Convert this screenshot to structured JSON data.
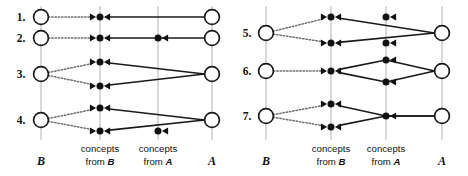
{
  "figure": {
    "background": "#ffffff",
    "ink_color": "#111111",
    "guide_color": "#b9b9b9",
    "dotted_color": "#6e6e6e"
  },
  "panels": [
    {
      "id": "left",
      "columns": [
        {
          "id": "B",
          "x": 41,
          "label_main": "B",
          "label_sub": ""
        },
        {
          "id": "conceptsB",
          "x": 100,
          "label_main": "concepts",
          "label_sub": "from B"
        },
        {
          "id": "conceptsA",
          "x": 158,
          "label_main": "concepts",
          "label_sub": "from A"
        },
        {
          "id": "A",
          "x": 212,
          "label_main": "A",
          "label_sub": ""
        }
      ],
      "rows": [
        {
          "label": "1.",
          "label_x": 21,
          "label_y": 17,
          "b_circles": [
            {
              "x": 41,
              "y": 17
            }
          ],
          "a_circles": [
            {
              "x": 212,
              "y": 17
            }
          ],
          "b_concepts": [
            {
              "x": 100,
              "y": 17
            }
          ],
          "a_concepts": [],
          "dotted": [
            {
              "x1": 41,
              "y1": 17,
              "x2": 100,
              "y2": 17
            }
          ],
          "solid": [
            {
              "x1": 212,
              "y1": 17,
              "x2": 100,
              "y2": 17
            }
          ]
        },
        {
          "label": "2.",
          "label_x": 21,
          "label_y": 38,
          "b_circles": [
            {
              "x": 41,
              "y": 38
            }
          ],
          "a_circles": [
            {
              "x": 212,
              "y": 38
            }
          ],
          "b_concepts": [
            {
              "x": 100,
              "y": 38
            }
          ],
          "a_concepts": [
            {
              "x": 158,
              "y": 38
            }
          ],
          "dotted": [
            {
              "x1": 41,
              "y1": 38,
              "x2": 100,
              "y2": 38
            }
          ],
          "solid": [
            {
              "x1": 212,
              "y1": 38,
              "x2": 100,
              "y2": 38
            }
          ]
        },
        {
          "label": "3.",
          "label_x": 21,
          "label_y": 74,
          "b_circles": [
            {
              "x": 41,
              "y": 74
            }
          ],
          "a_circles": [
            {
              "x": 212,
              "y": 74
            }
          ],
          "b_concepts": [
            {
              "x": 100,
              "y": 62
            },
            {
              "x": 100,
              "y": 86
            }
          ],
          "a_concepts": [],
          "dotted": [
            {
              "x1": 41,
              "y1": 74,
              "x2": 100,
              "y2": 62
            },
            {
              "x1": 41,
              "y1": 74,
              "x2": 100,
              "y2": 86
            }
          ],
          "solid": [
            {
              "x1": 212,
              "y1": 74,
              "x2": 100,
              "y2": 62
            },
            {
              "x1": 212,
              "y1": 74,
              "x2": 100,
              "y2": 86
            }
          ]
        },
        {
          "label": "4.",
          "label_x": 21,
          "label_y": 120,
          "b_circles": [
            {
              "x": 41,
              "y": 120
            }
          ],
          "a_circles": [
            {
              "x": 212,
              "y": 120
            }
          ],
          "b_concepts": [
            {
              "x": 100,
              "y": 108
            },
            {
              "x": 100,
              "y": 131
            }
          ],
          "a_concepts": [
            {
              "x": 158,
              "y": 131
            }
          ],
          "dotted": [
            {
              "x1": 41,
              "y1": 120,
              "x2": 100,
              "y2": 108
            },
            {
              "x1": 41,
              "y1": 120,
              "x2": 100,
              "y2": 131
            }
          ],
          "solid": [
            {
              "x1": 212,
              "y1": 120,
              "x2": 100,
              "y2": 108
            },
            {
              "x1": 212,
              "y1": 120,
              "x2": 100,
              "y2": 131
            }
          ]
        }
      ]
    },
    {
      "id": "right",
      "columns": [
        {
          "id": "B",
          "x": 32,
          "label_main": "B",
          "label_sub": ""
        },
        {
          "id": "conceptsB",
          "x": 97,
          "label_main": "concepts",
          "label_sub": "from B"
        },
        {
          "id": "conceptsA",
          "x": 152,
          "label_main": "concepts",
          "label_sub": "from A"
        },
        {
          "id": "A",
          "x": 208,
          "label_main": "A",
          "label_sub": ""
        }
      ],
      "rows": [
        {
          "label": "5.",
          "label_x": 13,
          "label_y": 33,
          "b_circles": [
            {
              "x": 32,
              "y": 33
            }
          ],
          "a_circles": [
            {
              "x": 208,
              "y": 33
            }
          ],
          "b_concepts": [
            {
              "x": 97,
              "y": 17
            },
            {
              "x": 97,
              "y": 43
            }
          ],
          "a_concepts": [
            {
              "x": 152,
              "y": 17
            },
            {
              "x": 152,
              "y": 43
            }
          ],
          "dotted": [
            {
              "x1": 32,
              "y1": 33,
              "x2": 97,
              "y2": 17
            },
            {
              "x1": 32,
              "y1": 33,
              "x2": 97,
              "y2": 43
            }
          ],
          "solid": [
            {
              "x1": 208,
              "y1": 33,
              "x2": 97,
              "y2": 17
            },
            {
              "x1": 208,
              "y1": 33,
              "x2": 97,
              "y2": 43
            }
          ]
        },
        {
          "label": "6.",
          "label_x": 13,
          "label_y": 71,
          "b_circles": [
            {
              "x": 32,
              "y": 71
            }
          ],
          "a_circles": [
            {
              "x": 208,
              "y": 71
            }
          ],
          "b_concepts": [
            {
              "x": 97,
              "y": 71
            }
          ],
          "a_concepts": [
            {
              "x": 152,
              "y": 60
            },
            {
              "x": 152,
              "y": 82
            }
          ],
          "dotted": [
            {
              "x1": 32,
              "y1": 71,
              "x2": 97,
              "y2": 71
            }
          ],
          "solid": [
            {
              "x1": 208,
              "y1": 71,
              "x2": 97,
              "y2": 71,
              "via_y": 60
            },
            {
              "x1": 208,
              "y1": 71,
              "x2": 97,
              "y2": 71,
              "via_y": 82
            }
          ]
        },
        {
          "label": "7.",
          "label_x": 13,
          "label_y": 116,
          "b_circles": [
            {
              "x": 32,
              "y": 116
            }
          ],
          "a_circles": [
            {
              "x": 208,
              "y": 116
            }
          ],
          "b_concepts": [
            {
              "x": 97,
              "y": 104
            },
            {
              "x": 97,
              "y": 127
            }
          ],
          "a_concepts": [
            {
              "x": 152,
              "y": 116
            }
          ],
          "dotted": [
            {
              "x1": 32,
              "y1": 116,
              "x2": 97,
              "y2": 104
            },
            {
              "x1": 32,
              "y1": 116,
              "x2": 97,
              "y2": 127
            }
          ],
          "solid": [
            {
              "x1": 208,
              "y1": 116,
              "x2": 97,
              "y2": 104,
              "pivot_x": 152,
              "pivot_y": 116
            },
            {
              "x1": 208,
              "y1": 116,
              "x2": 97,
              "y2": 127,
              "pivot_x": 152,
              "pivot_y": 116
            }
          ]
        }
      ]
    }
  ],
  "geometry": {
    "big_radius": 7.4,
    "node_radius": 3.5,
    "arrow_len": 6.2,
    "arrow_half": 3.6,
    "guide_top": 6,
    "guide_bottom": 140,
    "caption_y1": 152,
    "caption_y2": 165,
    "panel_width": 234,
    "panel_height": 176
  }
}
